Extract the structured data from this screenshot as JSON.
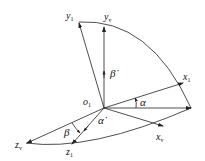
{
  "diagram": {
    "type": "coordinate-frame-rotation",
    "origin": {
      "label": "o",
      "sub": "1"
    },
    "axes": [
      {
        "id": "y1",
        "label": "y",
        "sub": "1"
      },
      {
        "id": "yv",
        "label": "y",
        "sub": "v"
      },
      {
        "id": "x1",
        "label": "x",
        "sub": "1"
      },
      {
        "id": "xv",
        "label": "x",
        "sub": "v"
      },
      {
        "id": "zv",
        "label": "z",
        "sub": "v"
      },
      {
        "id": "z1",
        "label": "z",
        "sub": "1"
      }
    ],
    "angles": [
      {
        "id": "alpha",
        "label": "α"
      },
      {
        "id": "beta",
        "label": "β"
      }
    ],
    "rates": [
      {
        "id": "beta-dot",
        "label": "β̇"
      },
      {
        "id": "alpha-dot",
        "label": "α̇"
      }
    ],
    "colors": {
      "stroke": "#222222",
      "background": "#ffffff"
    }
  }
}
